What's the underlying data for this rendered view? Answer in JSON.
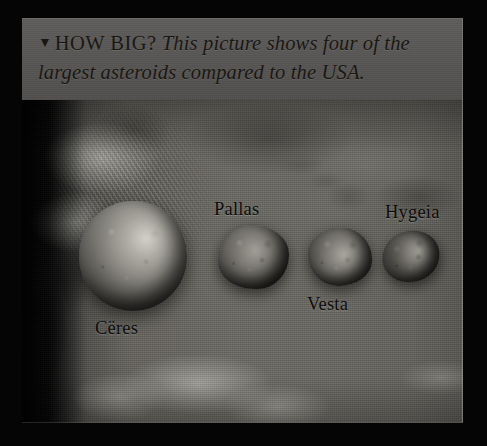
{
  "page": {
    "background_color": "#000000"
  },
  "caption": {
    "marker_icon": "▼",
    "marker_name": "down-triangle-bullet",
    "headline": "HOW BIG?",
    "body": "This picture shows four of the largest asteroids compared to the USA.",
    "box_color": "#565452",
    "text_color": "#1a1713"
  },
  "photo": {
    "alt_description": "Satellite map of the United States with four asteroids shown to scale",
    "base_color": "#6b6a68"
  },
  "asteroids": [
    {
      "name": "Ceres",
      "label": "Cëres",
      "label_name": "asteroid-label-ceres"
    },
    {
      "name": "Pallas",
      "label": "Pallas",
      "label_name": "asteroid-label-pallas"
    },
    {
      "name": "Vesta",
      "label": "Vesta",
      "label_name": "asteroid-label-vesta"
    },
    {
      "name": "Hygeia",
      "label": "Hygeia",
      "label_name": "asteroid-label-hygeia"
    }
  ]
}
